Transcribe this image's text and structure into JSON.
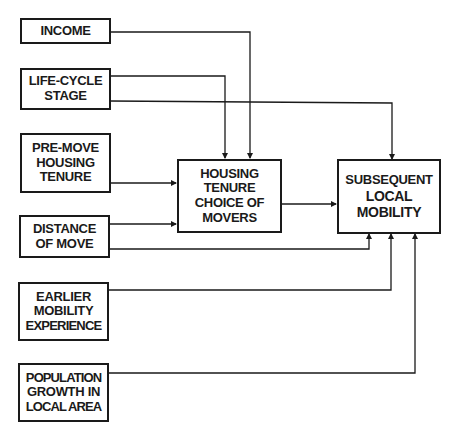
{
  "diagram": {
    "type": "flowchart",
    "nodes": {
      "income": {
        "lines": [
          "INCOME"
        ]
      },
      "life_cycle": {
        "lines": [
          "LIFE-CYCLE",
          "STAGE"
        ]
      },
      "pre_move": {
        "lines": [
          "PRE-MOVE",
          "HOUSING",
          "TENURE"
        ]
      },
      "distance": {
        "lines": [
          "DISTANCE",
          "OF MOVE"
        ]
      },
      "earlier": {
        "lines": [
          "EARLIER",
          "MOBILITY",
          "EXPERIENCE"
        ]
      },
      "population": {
        "lines": [
          "POPULATION",
          "GROWTH IN",
          "LOCAL AREA"
        ]
      },
      "housing_choice": {
        "lines": [
          "HOUSING",
          "TENURE",
          "CHOICE OF",
          "MOVERS"
        ]
      },
      "subsequent": {
        "lines": [
          "SUBSEQUENT",
          "LOCAL",
          "MOBILITY"
        ]
      }
    },
    "edges": [
      {
        "from": "INCOME",
        "to": "HOUSING TENURE CHOICE OF MOVERS"
      },
      {
        "from": "LIFE-CYCLE STAGE",
        "to": "HOUSING TENURE CHOICE OF MOVERS"
      },
      {
        "from": "LIFE-CYCLE STAGE",
        "to": "SUBSEQUENT LOCAL MOBILITY"
      },
      {
        "from": "PRE-MOVE HOUSING TENURE",
        "to": "HOUSING TENURE CHOICE OF MOVERS"
      },
      {
        "from": "DISTANCE OF MOVE",
        "to": "HOUSING TENURE CHOICE OF MOVERS"
      },
      {
        "from": "DISTANCE OF MOVE",
        "to": "SUBSEQUENT LOCAL MOBILITY"
      },
      {
        "from": "HOUSING TENURE CHOICE OF MOVERS",
        "to": "SUBSEQUENT LOCAL MOBILITY"
      },
      {
        "from": "EARLIER MOBILITY EXPERIENCE",
        "to": "SUBSEQUENT LOCAL MOBILITY"
      },
      {
        "from": "POPULATION GROWTH IN LOCAL AREA",
        "to": "SUBSEQUENT LOCAL MOBILITY"
      }
    ],
    "line_color": "#1a1a1a"
  }
}
